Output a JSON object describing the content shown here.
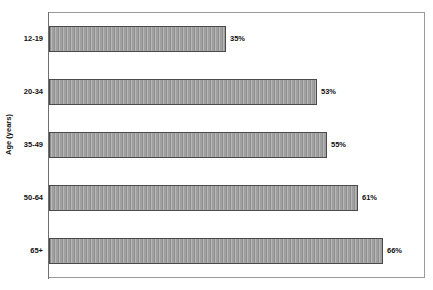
{
  "chart_data": {
    "type": "bar",
    "orientation": "horizontal",
    "title": "",
    "xlabel": "",
    "ylabel": "Age (years)",
    "categories": [
      "12-19",
      "20-34",
      "35-49",
      "50-64",
      "65+"
    ],
    "values": [
      35,
      53,
      55,
      61,
      66
    ],
    "value_labels": [
      "35%",
      "53%",
      "55%",
      "61%",
      "66%"
    ],
    "xlim": [
      0,
      74.5
    ],
    "grid": false,
    "legend": null,
    "series": [
      {
        "name": "",
        "values": [
          35,
          53,
          55,
          61,
          66
        ]
      }
    ],
    "bars": [
      {
        "category": "12-19",
        "value": 35,
        "label": "35%"
      },
      {
        "category": "20-34",
        "value": 53,
        "label": "53%"
      },
      {
        "category": "35-49",
        "value": 55,
        "label": "55%"
      },
      {
        "category": "50-64",
        "value": 61,
        "label": "61%"
      },
      {
        "category": "65+",
        "value": 66,
        "label": "66%"
      }
    ]
  },
  "colors": {
    "bar_fill": "#a5a5a5",
    "bar_stripe_dark": "#8f8f8f",
    "bar_stripe_light": "#b8b8b8",
    "bar_border": "#4a4a4a",
    "frame": "#9a9a9a",
    "axis": "#6f6f6f",
    "text": "#111111",
    "background": "#ffffff"
  }
}
